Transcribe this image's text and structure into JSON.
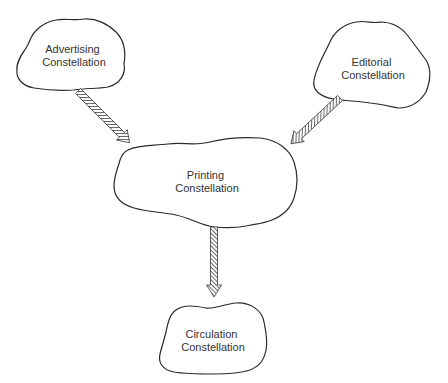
{
  "diagram": {
    "type": "flow",
    "nodes": [
      {
        "id": "advertising",
        "line1": "Advertising",
        "line2": "Constellation"
      },
      {
        "id": "editorial",
        "line1": "Editorial",
        "line2": "Constellation"
      },
      {
        "id": "printing",
        "line1": "Printing",
        "line2": "Constellation"
      },
      {
        "id": "circulation",
        "line1": "Circulation",
        "line2": "Constellation"
      }
    ],
    "edges": [
      {
        "from": "advertising",
        "to": "printing",
        "style": "hatched-arrow"
      },
      {
        "from": "editorial",
        "to": "printing",
        "style": "hatched-arrow"
      },
      {
        "from": "printing",
        "to": "circulation",
        "style": "hatched-arrow"
      }
    ],
    "colors": {
      "stroke": "#2a2a2a",
      "text": "#333333",
      "background": "#ffffff"
    }
  }
}
